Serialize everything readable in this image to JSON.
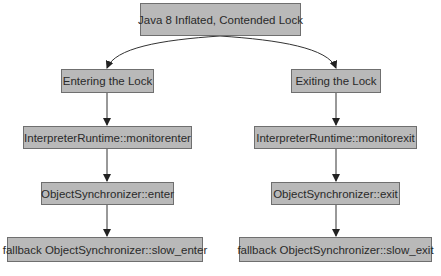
{
  "diagram": {
    "root": {
      "label": "Java 8 Inflated, Contended Lock"
    },
    "left": [
      {
        "label": "Entering the Lock"
      },
      {
        "label": "InterpreterRuntime::monitorenter"
      },
      {
        "label": "ObjectSynchronizer::enter"
      },
      {
        "label": "fallback ObjectSynchronizer::slow_enter"
      }
    ],
    "right": [
      {
        "label": "Exiting the Lock"
      },
      {
        "label": "InterpreterRuntime::monitorexit"
      },
      {
        "label": "ObjectSynchronizer::exit"
      },
      {
        "label": "fallback ObjectSynchronizer::slow_exit"
      }
    ],
    "colors": {
      "node_fill": "#b9b9b9",
      "node_border": "#6f6f6f",
      "edge": "#333333"
    }
  }
}
